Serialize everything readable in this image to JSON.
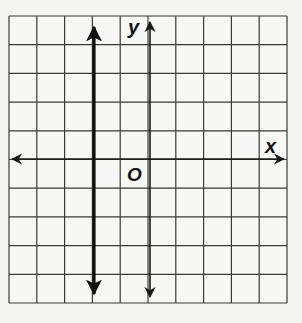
{
  "graph": {
    "title": "",
    "x_axis_label": "x",
    "y_axis_label": "y",
    "origin_label": "O",
    "grid": {
      "columns": 10,
      "rows": 10,
      "x_range": [
        -5,
        5
      ],
      "y_range": [
        -5,
        5
      ],
      "line_color": "#3a3a3a",
      "background": "#f7f7f5"
    },
    "axes_color": "#1a1a1a",
    "lines": [
      {
        "equation": "x = -2",
        "type": "vertical",
        "x": -2,
        "style": "bold",
        "arrows": "both",
        "color": "#111111"
      }
    ]
  }
}
